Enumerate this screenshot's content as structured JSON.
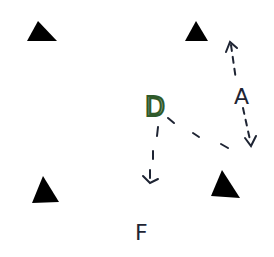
{
  "diagram": {
    "type": "hand-drawn drill diagram",
    "colors": {
      "background": "#ffffff",
      "cone": "#000000",
      "ink": "#1e2433",
      "player_d": "#2f5a2a"
    },
    "cones": [
      {
        "id": "cone-top-left",
        "shape": "triangle"
      },
      {
        "id": "cone-top-right",
        "shape": "triangle"
      },
      {
        "id": "cone-bottom-left",
        "shape": "triangle"
      },
      {
        "id": "cone-bottom-right",
        "shape": "triangle"
      }
    ],
    "players": [
      {
        "id": "player-d",
        "label": "D"
      },
      {
        "id": "player-a",
        "label": "A"
      },
      {
        "id": "player-f",
        "label": "F"
      }
    ],
    "movements": [
      {
        "id": "arrow-a-vertical",
        "from": "A",
        "style": "dashed",
        "heads": "both",
        "direction": "up-down"
      },
      {
        "id": "path-d-to-a",
        "from": "D",
        "to": "A",
        "style": "dashed",
        "heads": "none"
      },
      {
        "id": "arrow-d-to-f",
        "from": "D",
        "to": "F",
        "style": "dashed",
        "heads": "end"
      }
    ]
  }
}
